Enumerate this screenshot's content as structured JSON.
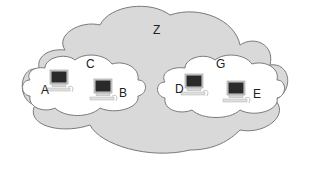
{
  "diagram": {
    "outer_cloud": {
      "label": "Z",
      "fill": "#d9d9d9",
      "stroke": "#7a7a7a"
    },
    "inner_clouds": [
      {
        "label": "C",
        "fill": "#ffffff",
        "stroke": "#7a7a7a",
        "computers": [
          {
            "label": "A"
          },
          {
            "label": "B"
          }
        ]
      },
      {
        "label": "G",
        "fill": "#ffffff",
        "stroke": "#7a7a7a",
        "computers": [
          {
            "label": "D"
          },
          {
            "label": "E"
          }
        ]
      }
    ],
    "colors": {
      "monitor_screen": "#2a2a2a",
      "monitor_frame": "#cfcfcf",
      "keyboard": "#e0e0e0"
    }
  }
}
